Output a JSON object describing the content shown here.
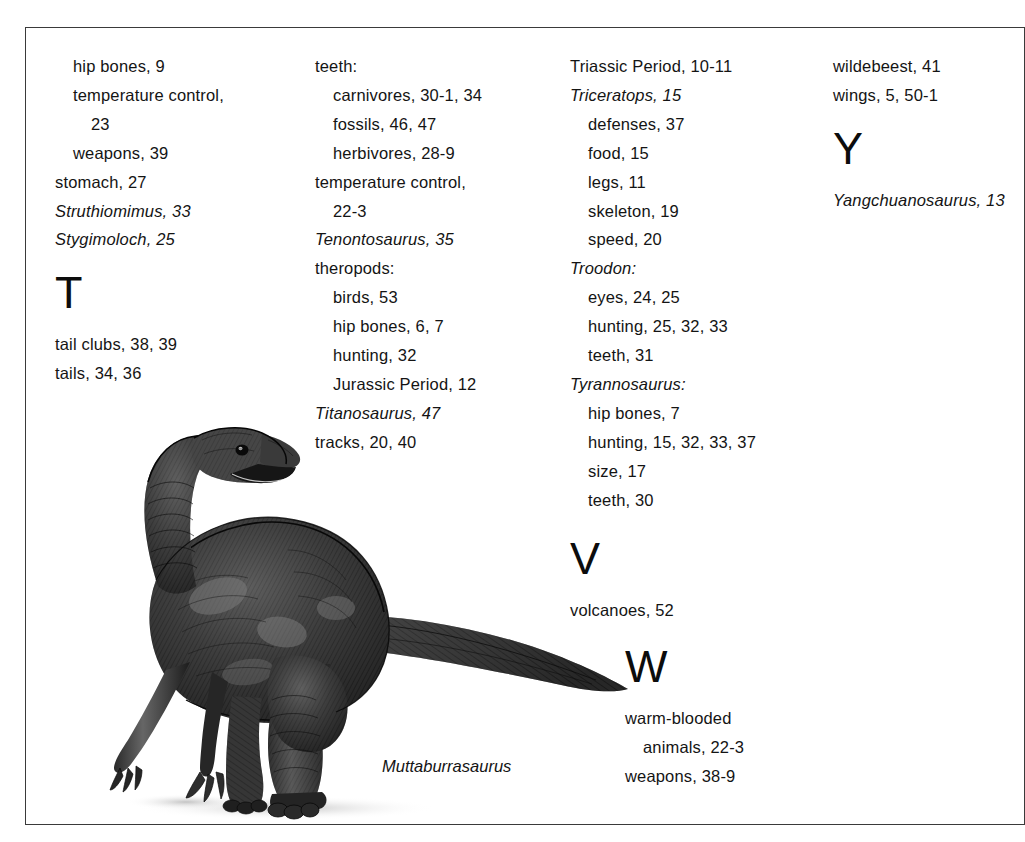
{
  "page": {
    "kind": "book-index-page",
    "background_color": "#ffffff",
    "border_color": "#3a3a3a",
    "text_color": "#141414"
  },
  "columns": [
    {
      "id": "col-1",
      "entries": [
        {
          "text": "hip bones, 9",
          "level": 1,
          "italic": false
        },
        {
          "text": "temperature control,",
          "level": 1,
          "italic": false
        },
        {
          "text": "23",
          "level": 2,
          "italic": false
        },
        {
          "text": "weapons, 39",
          "level": 1,
          "italic": false
        },
        {
          "text": "stomach, 27",
          "level": 0,
          "italic": false
        },
        {
          "text": "Struthiomimus, 33",
          "level": 0,
          "italic": true
        },
        {
          "text": "Stygimoloch, 25",
          "level": 0,
          "italic": true
        },
        {
          "text": "T",
          "level": 0,
          "italic": false,
          "letter_heading": true
        },
        {
          "text": "tail clubs, 38, 39",
          "level": 0,
          "italic": false
        },
        {
          "text": "tails, 34, 36",
          "level": 0,
          "italic": false
        }
      ]
    },
    {
      "id": "col-2",
      "entries": [
        {
          "text": "teeth:",
          "level": 0,
          "italic": false
        },
        {
          "text": "carnivores, 30-1, 34",
          "level": 1,
          "italic": false
        },
        {
          "text": "fossils, 46, 47",
          "level": 1,
          "italic": false
        },
        {
          "text": "herbivores, 28-9",
          "level": 1,
          "italic": false
        },
        {
          "text": "temperature control,",
          "level": 0,
          "italic": false
        },
        {
          "text": "22-3",
          "level": 1,
          "italic": false
        },
        {
          "text": "Tenontosaurus, 35",
          "level": 0,
          "italic": true
        },
        {
          "text": "theropods:",
          "level": 0,
          "italic": false
        },
        {
          "text": "birds, 53",
          "level": 1,
          "italic": false
        },
        {
          "text": "hip bones, 6, 7",
          "level": 1,
          "italic": false
        },
        {
          "text": "hunting, 32",
          "level": 1,
          "italic": false
        },
        {
          "text": "Jurassic Period, 12",
          "level": 1,
          "italic": false
        },
        {
          "text": "Titanosaurus, 47",
          "level": 0,
          "italic": true
        },
        {
          "text": "tracks, 20, 40",
          "level": 0,
          "italic": false
        }
      ]
    },
    {
      "id": "col-3",
      "entries": [
        {
          "text": "Triassic Period, 10-11",
          "level": 0,
          "italic": false
        },
        {
          "text": "Triceratops, 15",
          "level": 0,
          "italic": true
        },
        {
          "text": "defenses, 37",
          "level": 1,
          "italic": false
        },
        {
          "text": "food, 15",
          "level": 1,
          "italic": false
        },
        {
          "text": "legs, 11",
          "level": 1,
          "italic": false
        },
        {
          "text": "skeleton, 19",
          "level": 1,
          "italic": false
        },
        {
          "text": "speed, 20",
          "level": 1,
          "italic": false
        },
        {
          "text": "Troodon:",
          "level": 0,
          "italic": true
        },
        {
          "text": "eyes, 24, 25",
          "level": 1,
          "italic": false
        },
        {
          "text": "hunting, 25, 32, 33",
          "level": 1,
          "italic": false
        },
        {
          "text": "teeth, 31",
          "level": 1,
          "italic": false
        },
        {
          "text": "Tyrannosaurus:",
          "level": 0,
          "italic": true
        },
        {
          "text": "hip bones, 7",
          "level": 1,
          "italic": false
        },
        {
          "text": "hunting, 15, 32, 33, 37",
          "level": 1,
          "italic": false
        },
        {
          "text": "size, 17",
          "level": 1,
          "italic": false
        },
        {
          "text": "teeth, 30",
          "level": 1,
          "italic": false
        }
      ]
    },
    {
      "id": "col-4",
      "entries": [
        {
          "text": "wildebeest, 41",
          "level": 0,
          "italic": false
        },
        {
          "text": "wings, 5, 50-1",
          "level": 0,
          "italic": false
        },
        {
          "text": "Y",
          "level": 0,
          "italic": false,
          "letter_heading": true
        },
        {
          "text": "Yangchuanosaurus, 13",
          "level": 0,
          "italic": true
        }
      ]
    }
  ],
  "block_v": {
    "entries": [
      {
        "text": "V",
        "level": 0,
        "italic": false,
        "letter_heading": true
      },
      {
        "text": "volcanoes, 52",
        "level": 0,
        "italic": false
      }
    ]
  },
  "block_w": {
    "entries": [
      {
        "text": "W",
        "level": 0,
        "italic": false,
        "letter_heading": true
      },
      {
        "text": "warm-blooded",
        "level": 0,
        "italic": false
      },
      {
        "text": "animals, 22-3",
        "level": 1,
        "italic": false
      },
      {
        "text": "weapons, 38-9",
        "level": 0,
        "italic": false
      }
    ]
  },
  "figure": {
    "caption": "Muttaburrasaurus"
  }
}
